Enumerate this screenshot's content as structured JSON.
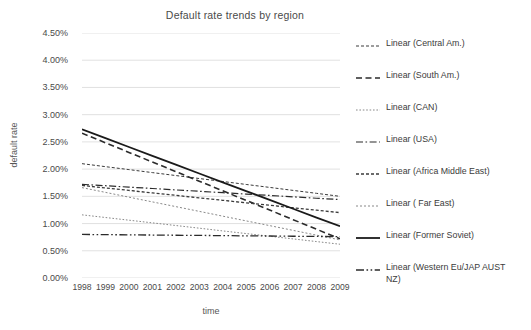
{
  "chart_data": {
    "type": "line",
    "title": "Default  rate trends  by region",
    "xlabel": "time",
    "ylabel": "default rate",
    "x": [
      1998,
      1999,
      2000,
      2001,
      2002,
      2003,
      2004,
      2005,
      2006,
      2007,
      2008,
      2009
    ],
    "categories": [
      "1998",
      "1999",
      "2000",
      "2001",
      "2002",
      "2003",
      "2004",
      "2005",
      "2006",
      "2007",
      "2008",
      "2009"
    ],
    "ylim": [
      0.0,
      4.5
    ],
    "y_ticks": [
      "0.00%",
      "0.50%",
      "1.00%",
      "1.50%",
      "2.00%",
      "2.50%",
      "3.00%",
      "3.50%",
      "4.00%",
      "4.50%"
    ],
    "y_tick_values": [
      0.0,
      0.5,
      1.0,
      1.5,
      2.0,
      2.5,
      3.0,
      3.5,
      4.0,
      4.5
    ],
    "y_unit": "%",
    "grid": "horizontal",
    "legend_position": "right",
    "note": "All series are linear trendlines; values are percentages.",
    "series": [
      {
        "name": "Linear (Central Am.)",
        "legend_label": "Linear (Central Am.)",
        "style": "dotted",
        "color": "#3b3b3b",
        "width": 1.0,
        "endpoints": {
          "start": 2.1,
          "end": 1.5
        },
        "values": [
          2.1,
          2.045,
          1.991,
          1.936,
          1.882,
          1.827,
          1.773,
          1.718,
          1.664,
          1.609,
          1.555,
          1.5
        ]
      },
      {
        "name": "Linear (South Am.)",
        "legend_label": "Linear (South Am.)",
        "style": "dashed",
        "color": "#2b2b2b",
        "width": 1.6,
        "endpoints": {
          "start": 2.66,
          "end": 0.72
        },
        "values": [
          2.66,
          2.484,
          2.307,
          2.131,
          1.954,
          1.778,
          1.602,
          1.425,
          1.249,
          1.072,
          0.896,
          0.72
        ]
      },
      {
        "name": "Linear (CAN)",
        "legend_label": "Linear (CAN)",
        "style": "fine-dotted",
        "color": "#7a7a7a",
        "width": 0.9,
        "endpoints": {
          "start": 1.16,
          "end": 0.62
        },
        "values": [
          1.16,
          1.111,
          1.062,
          1.013,
          0.964,
          0.915,
          0.865,
          0.816,
          0.767,
          0.718,
          0.669,
          0.62
        ]
      },
      {
        "name": "Linear (USA)",
        "legend_label": "Linear (USA)",
        "style": "dash-dot",
        "color": "#2b2b2b",
        "width": 1.2,
        "endpoints": {
          "start": 1.72,
          "end": 1.44
        },
        "values": [
          1.72,
          1.695,
          1.669,
          1.644,
          1.618,
          1.593,
          1.567,
          1.542,
          1.516,
          1.491,
          1.465,
          1.44
        ]
      },
      {
        "name": "Linear (Africa Middle East)",
        "legend_label": "Linear (Africa Middle East)",
        "style": "dotted",
        "color": "#3b3b3b",
        "width": 1.3,
        "endpoints": {
          "start": 1.7,
          "end": 1.2
        },
        "values": [
          1.7,
          1.654,
          1.609,
          1.563,
          1.518,
          1.472,
          1.427,
          1.381,
          1.336,
          1.29,
          1.245,
          1.2
        ]
      },
      {
        "name": "Linear ( Far East)",
        "legend_label": "Linear ( Far East)",
        "style": "light-dotted",
        "color": "#7a7a7a",
        "width": 0.9,
        "endpoints": {
          "start": 1.66,
          "end": 0.7
        },
        "values": [
          1.66,
          1.573,
          1.485,
          1.398,
          1.311,
          1.224,
          1.136,
          1.049,
          0.962,
          0.875,
          0.787,
          0.7
        ]
      },
      {
        "name": "Linear (Former Soviet)",
        "legend_label": "Linear (Former Soviet)",
        "style": "solid",
        "color": "#1a1a1a",
        "width": 1.8,
        "endpoints": {
          "start": 2.73,
          "end": 0.95
        },
        "values": [
          2.73,
          2.568,
          2.406,
          2.244,
          2.082,
          1.92,
          1.758,
          1.596,
          1.434,
          1.272,
          1.11,
          0.95
        ]
      },
      {
        "name": "Linear (Western Eu/JAP AUST NZ)",
        "legend_label": "Linear (Western Eu/JAP AUST\nNZ)",
        "style": "dash-dot-dot",
        "color": "#2b2b2b",
        "width": 1.3,
        "endpoints": {
          "start": 0.8,
          "end": 0.76
        },
        "values": [
          0.8,
          0.796,
          0.793,
          0.789,
          0.785,
          0.782,
          0.778,
          0.774,
          0.771,
          0.767,
          0.763,
          0.76
        ]
      }
    ]
  },
  "colors": {
    "background": "#ffffff",
    "gridline": "#d9d9d9",
    "text": "#3b3b3b",
    "tick_text": "#4a4a4a"
  }
}
